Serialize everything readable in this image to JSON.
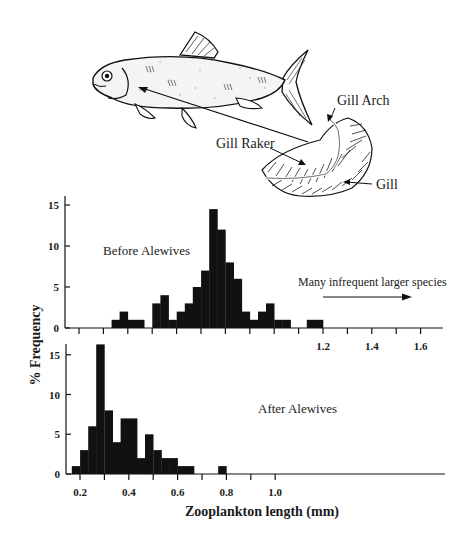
{
  "figure": {
    "illustration": {
      "subject": "alewife fish with gill structure",
      "labels": {
        "gill_arch": "Gill Arch",
        "gill_raker": "Gill Raker",
        "gill": "Gill"
      }
    },
    "y_axis_label": "% Frequency",
    "x_axis_label": "Zooplankton length (mm)"
  },
  "chart_data": [
    {
      "type": "bar",
      "title": "Before Alewives",
      "annotation": "Many infrequent larger species",
      "xlabel": "Zooplankton length (mm)",
      "ylabel": "% Frequency",
      "xlim": [
        0.15,
        1.7
      ],
      "ylim": [
        0,
        16
      ],
      "x_ticks": [
        1.2,
        1.4,
        1.6
      ],
      "y_ticks": [
        0,
        5,
        10,
        15
      ],
      "bin_width": 0.033,
      "bins": [
        {
          "x": 0.35,
          "value": 1
        },
        {
          "x": 0.383,
          "value": 2
        },
        {
          "x": 0.417,
          "value": 1
        },
        {
          "x": 0.45,
          "value": 1
        },
        {
          "x": 0.517,
          "value": 3
        },
        {
          "x": 0.55,
          "value": 4
        },
        {
          "x": 0.583,
          "value": 1
        },
        {
          "x": 0.617,
          "value": 2
        },
        {
          "x": 0.65,
          "value": 3
        },
        {
          "x": 0.683,
          "value": 5
        },
        {
          "x": 0.717,
          "value": 7
        },
        {
          "x": 0.75,
          "value": 14.5
        },
        {
          "x": 0.783,
          "value": 12
        },
        {
          "x": 0.817,
          "value": 8
        },
        {
          "x": 0.85,
          "value": 6
        },
        {
          "x": 0.883,
          "value": 2
        },
        {
          "x": 0.917,
          "value": 1
        },
        {
          "x": 0.95,
          "value": 2
        },
        {
          "x": 0.983,
          "value": 3
        },
        {
          "x": 1.017,
          "value": 1
        },
        {
          "x": 1.05,
          "value": 1
        },
        {
          "x": 1.15,
          "value": 1
        },
        {
          "x": 1.183,
          "value": 1
        }
      ]
    },
    {
      "type": "bar",
      "title": "After Alewives",
      "xlabel": "Zooplankton length (mm)",
      "ylabel": "% Frequency",
      "xlim": [
        0.15,
        1.7
      ],
      "ylim": [
        0,
        16
      ],
      "x_ticks": [
        0.2,
        0.4,
        0.6,
        0.8,
        1.0
      ],
      "y_ticks": [
        0,
        5,
        10,
        15
      ],
      "bin_width": 0.033,
      "bins": [
        {
          "x": 0.183,
          "value": 1
        },
        {
          "x": 0.217,
          "value": 3
        },
        {
          "x": 0.25,
          "value": 6
        },
        {
          "x": 0.283,
          "value": 16.3
        },
        {
          "x": 0.317,
          "value": 8
        },
        {
          "x": 0.35,
          "value": 4
        },
        {
          "x": 0.383,
          "value": 7
        },
        {
          "x": 0.417,
          "value": 7
        },
        {
          "x": 0.45,
          "value": 2
        },
        {
          "x": 0.483,
          "value": 5
        },
        {
          "x": 0.517,
          "value": 3
        },
        {
          "x": 0.55,
          "value": 2
        },
        {
          "x": 0.583,
          "value": 2
        },
        {
          "x": 0.617,
          "value": 1
        },
        {
          "x": 0.65,
          "value": 1
        },
        {
          "x": 0.783,
          "value": 1
        }
      ]
    }
  ]
}
